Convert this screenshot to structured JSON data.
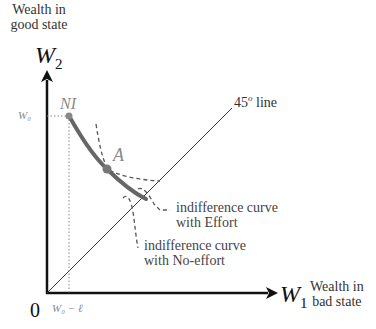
{
  "axes": {
    "y_title_line1": "Wealth in",
    "y_title_line2": "good state",
    "y_symbol": "W",
    "y_sub": "2",
    "x_symbol": "W",
    "x_sub": "1",
    "x_title_line1": "Wealth in",
    "x_title_line2": "bad state",
    "origin": "0"
  },
  "ticks": {
    "y_tick": "W₀",
    "x_tick": "W₀ − ℓ"
  },
  "points": {
    "ni": "NI",
    "a": "A"
  },
  "annotations": {
    "line45": "45",
    "line45_sup": "o",
    "line45_suffix": " line",
    "ic_effort_line1": "indifference curve",
    "ic_effort_line2": "with Effort",
    "ic_noeffort_line1": "indifference curve",
    "ic_noeffort_line2": "with No-effort"
  },
  "colors": {
    "axis": "#111111",
    "curve": "#666666",
    "dashed": "#555555",
    "label_gray": "#8a8a8a"
  }
}
